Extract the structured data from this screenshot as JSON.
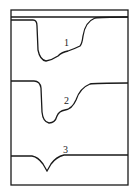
{
  "diagram": {
    "type": "stacked curve traces",
    "curves": [
      {
        "label": "1"
      },
      {
        "label": "2"
      },
      {
        "label": "3"
      }
    ],
    "colors": {
      "line": "#1a1a1a",
      "background": "#ffffff"
    }
  }
}
